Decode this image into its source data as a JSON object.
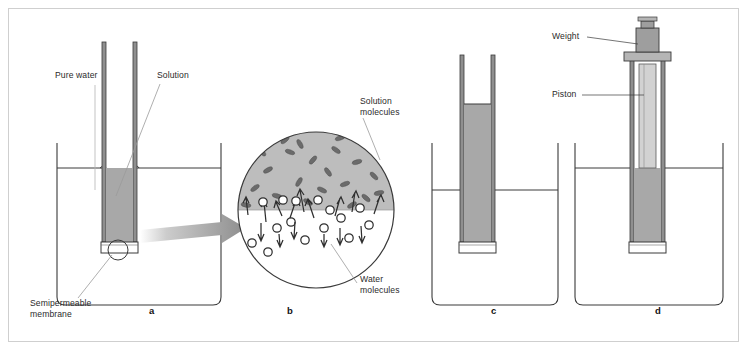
{
  "figure": {
    "background": "#ffffff",
    "frame_color": "#cfcfcf",
    "colors": {
      "solution_fill": "#a8a8a8",
      "solution_fill_light": "#c2c2c2",
      "piston_fill": "#d2d2d2",
      "weight_fill": "#9e9e9e",
      "outline": "#3a3a3a",
      "leader_line": "#9a9a9a",
      "water_line": "#3a3a3a",
      "magnifier_top": "#bdbdbd",
      "magnifier_bottom": "#ffffff",
      "molecule_outline": "#2f2f2f"
    }
  },
  "panels": [
    {
      "id": "a",
      "letter": "a",
      "caption_x": 149,
      "caption_y": 311,
      "description": "Tube with solution inserted in beaker of pure water; levels equal"
    },
    {
      "id": "b",
      "letter": "b",
      "caption_x": 287,
      "caption_y": 311,
      "description": "Magnified view of the semipermeable membrane interface"
    },
    {
      "id": "c",
      "letter": "c",
      "caption_x": 491,
      "caption_y": 311,
      "description": "Solution has risen in the tube by osmosis"
    },
    {
      "id": "d",
      "letter": "d",
      "caption_x": 655,
      "caption_y": 311,
      "description": "Weighted piston applies osmotic pressure, levels equal again"
    }
  ],
  "labels": [
    {
      "name": "pure-water-label",
      "text": "Pure water",
      "x": 55,
      "y": 76,
      "panel": "a"
    },
    {
      "name": "solution-label",
      "text": "Solution",
      "x": 157,
      "y": 76,
      "panel": "a"
    },
    {
      "name": "semipermeable-membrane-label",
      "text": "Semipermeable\nmembrane",
      "x": 30,
      "y": 302,
      "panel": "a"
    },
    {
      "name": "solution-molecules-label",
      "text": "Solution\nmolecules",
      "x": 360,
      "y": 100,
      "panel": "b"
    },
    {
      "name": "water-molecules-label",
      "text": "Water\nmolecules",
      "x": 360,
      "y": 278,
      "panel": "b"
    },
    {
      "name": "weight-label",
      "text": "Weight",
      "x": 552,
      "y": 33,
      "panel": "d"
    },
    {
      "name": "piston-label",
      "text": "Piston",
      "x": 552,
      "y": 91,
      "panel": "d"
    }
  ],
  "molecules": {
    "water_molecule_count": 18,
    "solution_molecule_count": 22,
    "up_arrows": 9,
    "down_arrows": 6,
    "note": "More water molecules move upward through the membrane than downward"
  }
}
